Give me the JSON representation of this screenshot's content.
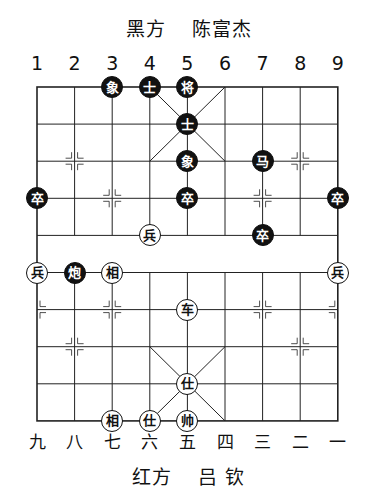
{
  "header": {
    "side": "黑方",
    "player": "陈富杰"
  },
  "footer": {
    "side": "红方",
    "player": "吕 钦"
  },
  "files_top": [
    "1",
    "2",
    "3",
    "4",
    "5",
    "6",
    "7",
    "8",
    "9"
  ],
  "files_bottom": [
    "九",
    "八",
    "七",
    "六",
    "五",
    "四",
    "三",
    "二",
    "一"
  ],
  "colors": {
    "line": "#222222",
    "black_piece": "#111111",
    "red_piece_fill": "#ffffff"
  },
  "pieces": [
    {
      "side": "black",
      "label": "象",
      "col": 2,
      "row": 0
    },
    {
      "side": "black",
      "label": "士",
      "col": 3,
      "row": 0
    },
    {
      "side": "black",
      "label": "将",
      "col": 4,
      "row": 0
    },
    {
      "side": "black",
      "label": "士",
      "col": 4,
      "row": 1
    },
    {
      "side": "black",
      "label": "象",
      "col": 4,
      "row": 2
    },
    {
      "side": "black",
      "label": "马",
      "col": 6,
      "row": 2
    },
    {
      "side": "black",
      "label": "卒",
      "col": 0,
      "row": 3
    },
    {
      "side": "black",
      "label": "卒",
      "col": 4,
      "row": 3
    },
    {
      "side": "black",
      "label": "卒",
      "col": 8,
      "row": 3
    },
    {
      "side": "black",
      "label": "卒",
      "col": 6,
      "row": 4
    },
    {
      "side": "red",
      "label": "兵",
      "col": 3,
      "row": 4
    },
    {
      "side": "red",
      "label": "兵",
      "col": 0,
      "row": 5
    },
    {
      "side": "black",
      "label": "炮",
      "col": 1,
      "row": 5
    },
    {
      "side": "red",
      "label": "相",
      "col": 2,
      "row": 5
    },
    {
      "side": "red",
      "label": "兵",
      "col": 8,
      "row": 5
    },
    {
      "side": "red",
      "label": "车",
      "col": 4,
      "row": 6
    },
    {
      "side": "red",
      "label": "仕",
      "col": 4,
      "row": 8
    },
    {
      "side": "red",
      "label": "相",
      "col": 2,
      "row": 9
    },
    {
      "side": "red",
      "label": "仕",
      "col": 3,
      "row": 9
    },
    {
      "side": "red",
      "label": "帅",
      "col": 4,
      "row": 9
    }
  ]
}
